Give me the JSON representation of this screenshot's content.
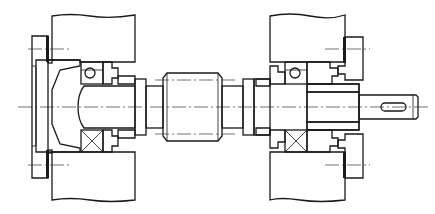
{
  "diagram": {
    "type": "mechanical cross-section",
    "colors": {
      "line": "#1a1a1a",
      "background": "#ffffff"
    },
    "components": [
      {
        "id": "left-housing-wall",
        "label": ""
      },
      {
        "id": "left-end-cover",
        "label": ""
      },
      {
        "id": "left-bearing-ball",
        "label": ""
      },
      {
        "id": "left-bearing-roller",
        "label": ""
      },
      {
        "id": "left-shaft-stub",
        "label": ""
      },
      {
        "id": "coupling-sleeve",
        "label": ""
      },
      {
        "id": "right-housing-wall",
        "label": ""
      },
      {
        "id": "right-end-cover",
        "label": ""
      },
      {
        "id": "right-bearing-ball",
        "label": ""
      },
      {
        "id": "right-bearing-roller",
        "label": ""
      },
      {
        "id": "output-shaft",
        "label": ""
      },
      {
        "id": "keyway",
        "label": ""
      },
      {
        "id": "centerline",
        "label": ""
      }
    ]
  }
}
